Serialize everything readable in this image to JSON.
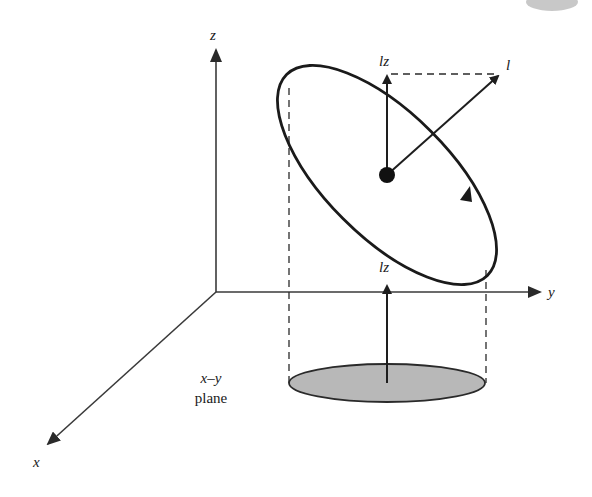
{
  "diagram": {
    "colors": {
      "stroke": "#1a1a1a",
      "axis": "#3a3a3a",
      "disc_fill": "#b8b8b8",
      "background": "#ffffff",
      "corner_blob": "#9a9a9a"
    },
    "axes": {
      "origin": [
        216,
        292
      ],
      "x": {
        "label": "x",
        "tip": [
          46,
          446
        ]
      },
      "y": {
        "label": "y",
        "tip": [
          540,
          292
        ]
      },
      "z": {
        "label": "z",
        "tip": [
          216,
          48
        ]
      }
    },
    "orbit": {
      "center": [
        387,
        175
      ],
      "shape": "tilted ellipse",
      "direction_arrow_at": [
        465,
        192
      ]
    },
    "vectors": {
      "angular_momentum": {
        "label": "l",
        "from": [
          387,
          175
        ],
        "to": [
          500,
          74
        ]
      },
      "z_component": {
        "label": "lz",
        "from": [
          387,
          175
        ],
        "to": [
          387,
          74
        ]
      },
      "projected_z_component": {
        "label": "lz",
        "from": [
          387,
          383
        ],
        "to": [
          387,
          284
        ]
      }
    },
    "projection": {
      "disc_center": [
        387,
        383
      ],
      "disc_rx": 98,
      "disc_ry": 19,
      "plane_label_line1": "x–y",
      "plane_label_line2": "plane"
    },
    "labels": {
      "z_axis": "z",
      "y_axis": "y",
      "x_axis": "x",
      "l_vector": "l",
      "lz_top": "lz",
      "lz_bottom": "lz",
      "plane_line1": "x–y",
      "plane_line2": "plane"
    }
  }
}
